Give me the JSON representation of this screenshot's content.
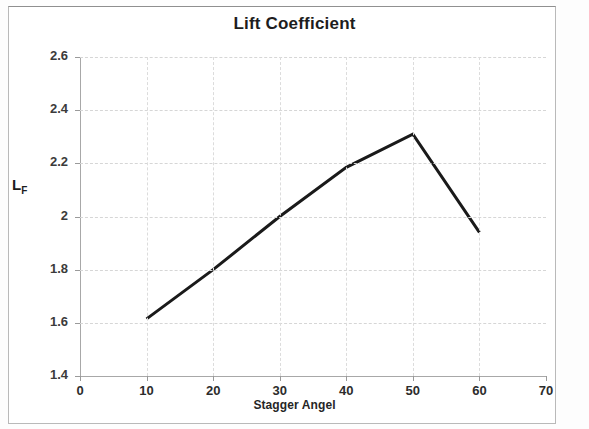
{
  "chart_data": {
    "type": "line",
    "title": "Lift Coefficient",
    "xlabel": "Stagger Angel",
    "ylabel": "L_F",
    "ylabel_base": "L",
    "ylabel_sub": "F",
    "x": [
      10,
      20,
      30,
      40,
      50,
      60
    ],
    "values": [
      1.615,
      1.8,
      2.0,
      2.185,
      2.31,
      1.94
    ],
    "series": [
      {
        "name": "Lift Coefficient",
        "values": [
          1.615,
          1.8,
          2.0,
          2.185,
          2.31,
          1.94
        ]
      }
    ],
    "xlim": [
      0,
      70
    ],
    "ylim": [
      1.4,
      2.6
    ],
    "xticks": [
      0,
      10,
      20,
      30,
      40,
      50,
      60,
      70
    ],
    "xtick_labels": [
      "0",
      "10",
      "20",
      "30",
      "40",
      "50",
      "60",
      "70"
    ],
    "yticks": [
      1.4,
      1.6,
      1.8,
      2.0,
      2.2,
      2.4,
      2.6
    ],
    "ytick_labels": [
      "1.4",
      "1.6",
      "1.8",
      "2",
      "2.2",
      "2.4",
      "2.6"
    ],
    "grid": true,
    "grid_style": "dashed",
    "legend": false,
    "line_color": "#1a1a1a",
    "line_width": 3,
    "markers": false,
    "background_color": "#ffffff",
    "grid_color": "#d6d6d6"
  }
}
